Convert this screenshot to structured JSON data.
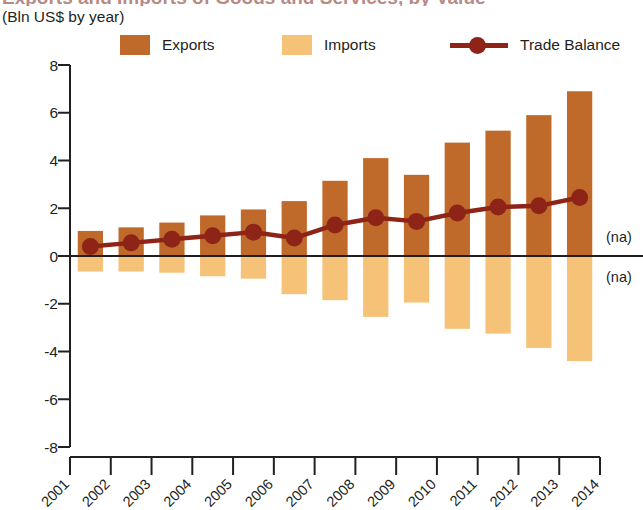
{
  "header": {
    "title": "Exports and Imports of Goods and Services, by Value",
    "subtitle": "(Bln US$ by year)"
  },
  "legend": {
    "exports_label": "Exports",
    "imports_label": "Imports",
    "balance_label": "Trade Balance"
  },
  "annotations": {
    "na_upper": "(na)",
    "na_lower": "(na)"
  },
  "colors": {
    "exports": "#BF6A2A",
    "imports": "#F5C277",
    "balance": "#8E2418",
    "axis": "#231f20",
    "title": "#7d2b1d"
  },
  "chart_data": {
    "type": "bar",
    "title": "Exports and Imports of Goods and Services, by Value",
    "subtitle": "(Bln US$ by year)",
    "xlabel": "",
    "ylabel": "Bln US$",
    "ylim": [
      -8,
      8
    ],
    "yticks": [
      8,
      6,
      4,
      2,
      0,
      -2,
      -4,
      -6,
      -8
    ],
    "ytick_labels": [
      "8",
      "6",
      "4",
      "2",
      "0",
      "-2",
      "-4",
      "-6",
      "-8"
    ],
    "grid": false,
    "legend_position": "top",
    "categories": [
      "2001",
      "2002",
      "2003",
      "2004",
      "2005",
      "2006",
      "2007",
      "2008",
      "2009",
      "2010",
      "2011",
      "2012",
      "2013"
    ],
    "xtick_labels": [
      "2001",
      "2002",
      "2003",
      "2004",
      "2005",
      "2006",
      "2007",
      "2008",
      "2009",
      "2010",
      "2011",
      "2012",
      "2013",
      "2014"
    ],
    "series": [
      {
        "name": "Exports",
        "type": "bar",
        "color": "#BF6A2A",
        "values": [
          1.05,
          1.2,
          1.4,
          1.7,
          1.95,
          2.3,
          3.15,
          4.1,
          3.4,
          4.75,
          5.25,
          5.9,
          6.9
        ]
      },
      {
        "name": "Imports",
        "type": "bar",
        "color": "#F5C277",
        "values": [
          -0.65,
          -0.65,
          -0.7,
          -0.85,
          -0.95,
          -1.6,
          -1.85,
          -2.55,
          -1.95,
          -3.05,
          -3.25,
          -3.85,
          -4.4
        ]
      },
      {
        "name": "Trade Balance",
        "type": "line",
        "color": "#8E2418",
        "values": [
          0.4,
          0.55,
          0.7,
          0.85,
          1.0,
          0.75,
          1.3,
          1.6,
          1.45,
          1.8,
          2.05,
          2.1,
          2.45
        ]
      }
    ]
  }
}
